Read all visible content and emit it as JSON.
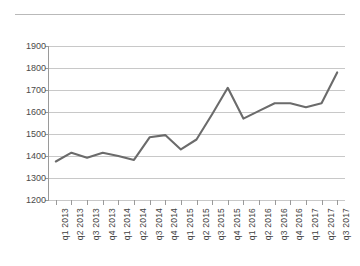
{
  "document": {
    "separator_rule": true
  },
  "chart_data": {
    "type": "line",
    "title": "",
    "subtitle": "",
    "xlabel": "",
    "ylabel": "",
    "grid": true,
    "legend": "none",
    "line_color": "#6b6b6b",
    "gridline_color": "#c8c8c8",
    "axis_color": "#9a9a9a",
    "ylim": [
      1200,
      1900
    ],
    "ytick_step": 100,
    "ytick_labels": [
      "1900",
      "1800",
      "1700",
      "1600",
      "1500",
      "1400",
      "1300",
      "1200"
    ],
    "yticks": [
      1900,
      1800,
      1700,
      1600,
      1500,
      1400,
      1300,
      1200
    ],
    "categories": [
      "q1 2013",
      "q2 2013",
      "q3 2013",
      "q4 2013",
      "q1 2014",
      "q2 2014",
      "q3 2014",
      "q4 2014",
      "q1 2015",
      "q2 2015",
      "q3 2015",
      "q4 2015",
      "q1 2016",
      "q2 2016",
      "q3 2016",
      "q4 2016",
      "q1 2017",
      "q2 2017",
      "q3 2017"
    ],
    "values": [
      1375,
      1415,
      1392,
      1415,
      1400,
      1382,
      1485,
      1495,
      1430,
      1475,
      1590,
      1710,
      1570,
      1605,
      1640,
      1640,
      1622,
      1640,
      1780
    ]
  }
}
